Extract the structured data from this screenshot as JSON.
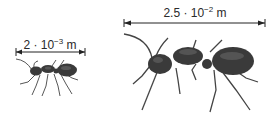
{
  "figure": {
    "small_ant": {
      "label_base": "2 · 10",
      "label_exp": "−3",
      "label_unit": " m",
      "length_m": 0.002
    },
    "large_ant": {
      "label_base": "2.5 · 10",
      "label_exp": "−2",
      "label_unit": " m",
      "length_m": 0.025
    },
    "colors": {
      "ant_body": "#3a3a3a",
      "ant_highlight": "#6a6a6a",
      "line": "#222222"
    }
  }
}
